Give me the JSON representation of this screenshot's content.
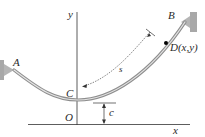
{
  "diagram": {
    "labels": {
      "A": "A",
      "B": "B",
      "C": "C",
      "D": "D(x,y)",
      "O": "O",
      "x_axis": "x",
      "y_axis": "y",
      "s": "s",
      "c": "c"
    },
    "colors": {
      "cable": "#9a9a9a",
      "cable_highlight": "#e6e6e6",
      "support": "#a8a8a8",
      "axis": "#333333",
      "point_D": "#000000"
    }
  }
}
